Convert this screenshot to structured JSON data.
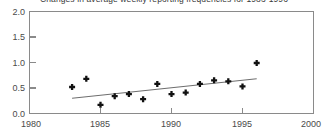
{
  "chart_data": {
    "type": "scatter",
    "title": "Changes in average weekly reporting frequencies for 1983-1996",
    "xlabel": "",
    "ylabel": "",
    "xlim": [
      1980,
      2000
    ],
    "ylim": [
      0.0,
      2.0
    ],
    "xticks": [
      1980,
      1985,
      1990,
      1995,
      2000
    ],
    "xtick_labels": [
      "1980",
      "1985",
      "1990",
      "1995",
      "2000"
    ],
    "yticks": [
      0.0,
      0.5,
      1.0,
      1.5,
      2.0
    ],
    "ytick_labels": [
      "0.0",
      "0.5",
      "1.0",
      "1.5",
      "2.0"
    ],
    "grid": false,
    "legend": "none",
    "marker_color": "#111111",
    "trend_color": "#6e6e6e",
    "axis_color": "#8a8a8a",
    "x": [
      1983,
      1984,
      1985,
      1986,
      1987,
      1988,
      1989,
      1990,
      1991,
      1992,
      1993,
      1994,
      1995,
      1996
    ],
    "values": [
      0.52,
      0.68,
      0.17,
      0.34,
      0.38,
      0.28,
      0.58,
      0.38,
      0.41,
      0.58,
      0.65,
      0.63,
      0.53,
      0.99
    ],
    "series": [
      {
        "name": "Average weekly reporting frequency",
        "type": "scatter",
        "x": [
          1983,
          1984,
          1985,
          1986,
          1987,
          1988,
          1989,
          1990,
          1991,
          1992,
          1993,
          1994,
          1995,
          1996
        ],
        "values": [
          0.52,
          0.68,
          0.17,
          0.34,
          0.38,
          0.28,
          0.58,
          0.38,
          0.41,
          0.58,
          0.65,
          0.63,
          0.53,
          0.99
        ]
      },
      {
        "name": "Linear trend",
        "type": "line",
        "x": [
          1983,
          1996
        ],
        "values": [
          0.3,
          0.68
        ]
      }
    ],
    "annotations": []
  }
}
